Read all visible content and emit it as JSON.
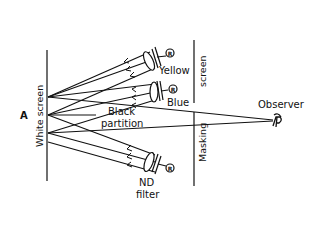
{
  "diagram": {
    "point_label": "A",
    "white_screen_label": "White screen",
    "masking_screen_top_label": "screen",
    "masking_screen_bottom_label": "Masking",
    "observer_label": "Observer",
    "lamps": [
      {
        "label": "Yellow",
        "icon": "lamp-lens-icon",
        "marker": "R"
      },
      {
        "label": "Blue",
        "icon": "lamp-lens-icon",
        "marker": "R"
      },
      {
        "label": "ND filter",
        "line1": "ND",
        "line2": "filter",
        "icon": "lamp-lens-icon",
        "marker": "R"
      }
    ],
    "partition_label_line1": "Black",
    "partition_label_line2": "partition",
    "colors": {
      "ink": "#111111",
      "background": "#ffffff"
    }
  }
}
